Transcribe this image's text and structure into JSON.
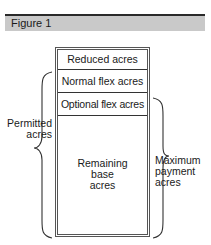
{
  "figure": {
    "title": "Figure 1"
  },
  "stack": {
    "rows": [
      {
        "label": "Reduced acres"
      },
      {
        "label": "Normal flex acres"
      },
      {
        "label": "Optional flex acres"
      },
      {
        "label_lines": [
          "Remaining",
          "base",
          "acres"
        ]
      }
    ]
  },
  "braces": {
    "left": {
      "label_lines": [
        "Permitted",
        "acres"
      ],
      "spans": "Normal flex acres through Remaining base acres"
    },
    "right": {
      "label_lines": [
        "Maximum",
        "payment",
        "acres"
      ],
      "spans": "Optional flex acres through Remaining base acres"
    }
  },
  "colors": {
    "header_band": "#c9c9c9",
    "header_rule": "#2a2a2a",
    "line": "#333333"
  }
}
